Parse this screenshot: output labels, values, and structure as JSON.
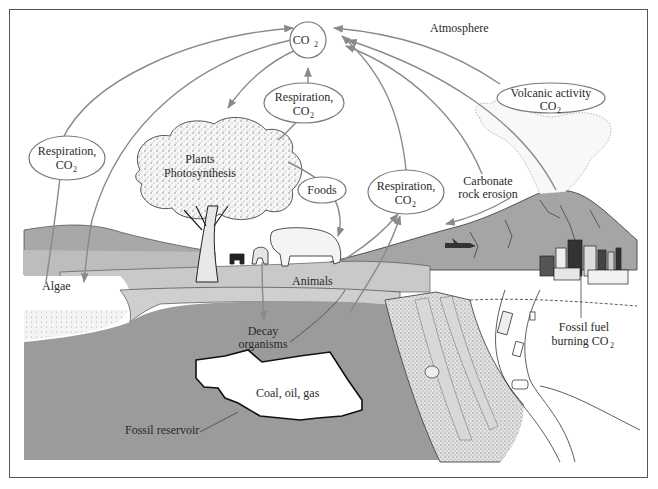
{
  "colors": {
    "background": "#ffffff",
    "frame": "#555555",
    "ground_dark": "#9b9b9b",
    "ground_light": "#c9c9c9",
    "hills": "#a8a8a8",
    "arrow": "#8a8a8a",
    "text": "#2a2a2a"
  },
  "labels": {
    "co2_center": "CO",
    "co2_sub": "2",
    "atmosphere": "Atmosphere",
    "respiration_left_line1": "Respiration,",
    "respiration_left_line2": "CO",
    "respiration_top_line1": "Respiration,",
    "respiration_top_line2": "CO",
    "respiration_right_line1": "Respiration,",
    "respiration_right_line2": "CO",
    "volcanic_line1": "Volcanic activity",
    "volcanic_line2": "CO",
    "plants_line1": "Plants",
    "plants_line2": "Photosynthesis",
    "foods": "Foods",
    "carbonate_line1": "Carbonate",
    "carbonate_line2": "rock erosion",
    "algae": "Algae",
    "animals": "Animals",
    "decay_line1": "Decay",
    "decay_line2": "organisms",
    "coal_oil_gas": "Coal, oil, gas",
    "fossil_reservoir": "Fossil reservoir",
    "fossil_fuel_line1": "Fossil fuel",
    "fossil_fuel_line2": "burning CO",
    "subscript_2": "2"
  },
  "flows": [
    {
      "from": "Respiration, CO2 (algae)",
      "to": "CO2"
    },
    {
      "from": "CO2",
      "to": "Algae"
    },
    {
      "from": "CO2",
      "to": "Plants Photosynthesis"
    },
    {
      "from": "Respiration, CO2 (plants)",
      "to": "CO2"
    },
    {
      "from": "Plants Photosynthesis",
      "to": "Foods"
    },
    {
      "from": "Foods",
      "to": "Animals"
    },
    {
      "from": "Respiration, CO2 (animals)",
      "to": "CO2"
    },
    {
      "from": "Carbonate rock erosion",
      "to": "CO2"
    },
    {
      "from": "Volcanic activity CO2",
      "to": "CO2"
    },
    {
      "from": "Fossil fuel burning CO2",
      "to": "CO2"
    },
    {
      "from": "Animals",
      "to": "Decay organisms"
    },
    {
      "from": "Carbonate rock erosion",
      "to": "Land"
    }
  ]
}
